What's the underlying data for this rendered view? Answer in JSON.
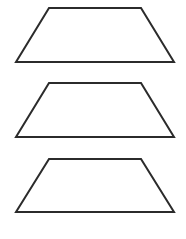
{
  "diagram": {
    "background": "#ffffff",
    "stroke_color": "#2b2b2b",
    "stroke_width": 2,
    "fill": "none",
    "shapes": [
      {
        "type": "trapezoid",
        "label": "trapezoid-1",
        "points": [
          [
            49,
            8
          ],
          [
            141,
            8
          ],
          [
            174,
            62
          ],
          [
            16,
            62
          ]
        ]
      },
      {
        "type": "trapezoid",
        "label": "trapezoid-2",
        "points": [
          [
            49,
            83
          ],
          [
            141,
            83
          ],
          [
            174,
            137
          ],
          [
            16,
            137
          ]
        ]
      },
      {
        "type": "trapezoid",
        "label": "trapezoid-3",
        "points": [
          [
            49,
            159
          ],
          [
            141,
            159
          ],
          [
            174,
            212
          ],
          [
            16,
            212
          ]
        ]
      }
    ]
  }
}
